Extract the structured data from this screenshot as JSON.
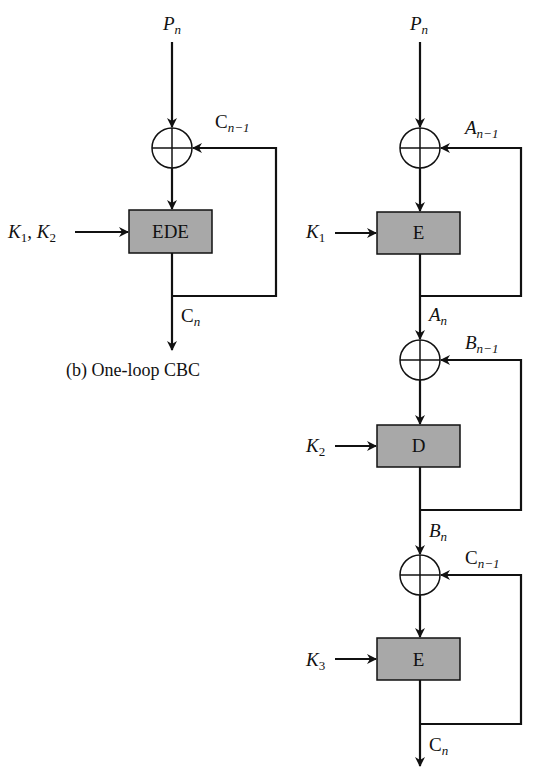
{
  "diagram": {
    "left": {
      "caption": "(b) One-loop CBC",
      "input_label": {
        "base": "P",
        "sub": "n"
      },
      "feedback_label": {
        "base": "C",
        "sub": "n−1"
      },
      "key_label": {
        "k1": "K",
        "k1_sub": "1",
        "sep": ", ",
        "k2": "K",
        "k2_sub": "2"
      },
      "block_label": "EDE",
      "output_label": {
        "base": "C",
        "sub": "n"
      }
    },
    "right": {
      "input_label": {
        "base": "P",
        "sub": "n"
      },
      "stages": [
        {
          "feedback": {
            "base": "A",
            "sub": "n−1"
          },
          "key": {
            "base": "K",
            "sub": "1"
          },
          "block": "E",
          "output": {
            "base": "A",
            "sub": "n"
          }
        },
        {
          "feedback": {
            "base": "B",
            "sub": "n−1"
          },
          "key": {
            "base": "K",
            "sub": "2"
          },
          "block": "D",
          "output": {
            "base": "B",
            "sub": "n"
          }
        },
        {
          "feedback": {
            "base": "C",
            "sub": "n−1"
          },
          "key": {
            "base": "K",
            "sub": "3"
          },
          "block": "E",
          "output": {
            "base": "C",
            "sub": "n"
          }
        }
      ]
    },
    "colors": {
      "block_fill": "#a8a8a8",
      "line": "#111111",
      "background": "#ffffff"
    }
  }
}
